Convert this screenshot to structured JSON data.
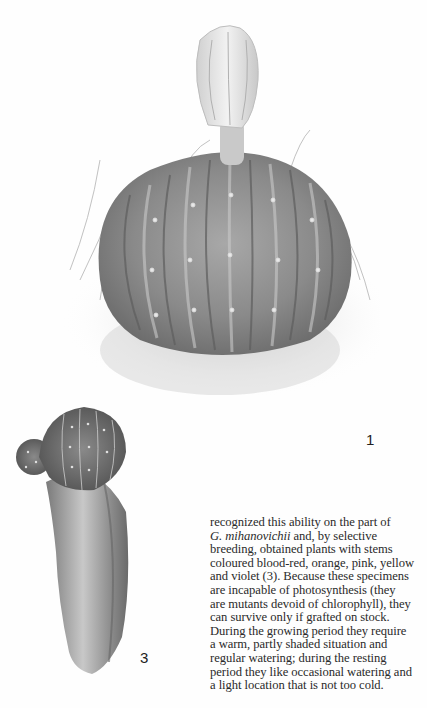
{
  "page": {
    "type": "book-page",
    "figures": [
      {
        "id": "fig-1",
        "label": "1",
        "description": "Large globular ribbed cactus with tall pale flower bud, surrounded by grass"
      },
      {
        "id": "fig-3",
        "label": "3",
        "description": "Small colourful ribbed cactus grafted onto columnar stock"
      }
    ],
    "body_text": {
      "lines": [
        {
          "before": "recognized this ability on the part of",
          "italic": "",
          "after": ""
        },
        {
          "before": "",
          "italic": "G. mihanovichii",
          "after": " and, by selective"
        },
        {
          "before": "breeding, obtained plants with stems",
          "italic": "",
          "after": ""
        },
        {
          "before": "coloured blood-red, orange, pink, yellow",
          "italic": "",
          "after": ""
        },
        {
          "before": "and violet (3). Because these specimens",
          "italic": "",
          "after": ""
        },
        {
          "before": "are incapable of photosynthesis (they",
          "italic": "",
          "after": ""
        },
        {
          "before": "are mutants devoid of chlorophyll), they",
          "italic": "",
          "after": ""
        },
        {
          "before": "can survive only if grafted on stock.",
          "italic": "",
          "after": ""
        },
        {
          "before": "During the growing period they require",
          "italic": "",
          "after": ""
        },
        {
          "before": "a warm, partly shaded situation and",
          "italic": "",
          "after": ""
        },
        {
          "before": "regular watering; during the resting",
          "italic": "",
          "after": ""
        },
        {
          "before": "period they like occasional watering and",
          "italic": "",
          "after": ""
        },
        {
          "before": "a light location that is not too cold.",
          "italic": "",
          "after": ""
        }
      ]
    },
    "colors": {
      "paper": "#fefefe",
      "text": "#2a2a2a",
      "cactus_dark": "#6e6e6e",
      "cactus_mid": "#9a9a9a",
      "cactus_light": "#d8d8d8"
    }
  }
}
